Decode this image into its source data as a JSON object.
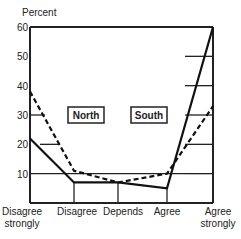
{
  "chart_data": {
    "type": "line",
    "title": "",
    "ylabel": "Percent",
    "xlabel": "",
    "ylim": [
      0,
      60
    ],
    "yticks": [
      10,
      20,
      30,
      40,
      50,
      60
    ],
    "categories": [
      "Disagree strongly",
      "Disagree",
      "Depends",
      "Agree",
      "Agree strongly"
    ],
    "category_lines": [
      [
        "Disagree",
        "strongly"
      ],
      [
        "Disagree"
      ],
      [
        "Depends"
      ],
      [
        "Agree"
      ],
      [
        "Agree",
        "strongly"
      ]
    ],
    "series": [
      {
        "name": "South",
        "style": "solid",
        "values": [
          22,
          7,
          7,
          5,
          60
        ]
      },
      {
        "name": "North",
        "style": "dashed",
        "values": [
          38,
          11,
          7,
          10,
          33
        ]
      }
    ],
    "legend": [
      "North",
      "South"
    ],
    "legend_position": "inside-center",
    "grid": "partial horizontal"
  }
}
